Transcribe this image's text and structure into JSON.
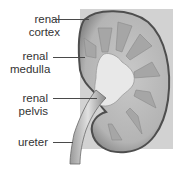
{
  "diagram": {
    "labels": [
      {
        "id": "cortex",
        "line1": "renal",
        "line2": "cortex"
      },
      {
        "id": "medulla",
        "line1": "renal",
        "line2": "medulla"
      },
      {
        "id": "pelvis",
        "line1": "renal",
        "line2": "pelvis"
      },
      {
        "id": "ureter",
        "line1": "ureter",
        "line2": ""
      }
    ],
    "colors": {
      "background_panel": "#d2d2d2",
      "kidney_outline": "#5a5a5a",
      "cortex": "#bdbdbd",
      "medulla": "#a8a8a8",
      "pelvis": "#e6e6e6",
      "text": "#333333"
    }
  }
}
